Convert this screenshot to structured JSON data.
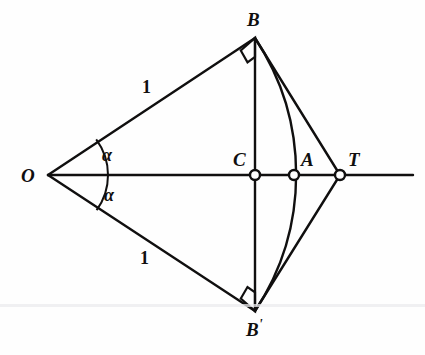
{
  "figure": {
    "background_color": "#fefefe",
    "stroke_color": "#100f0f",
    "canvas": {
      "width": 425,
      "height": 355
    }
  },
  "points": [
    {
      "id": "O",
      "label": "O",
      "x": 48,
      "y": 175,
      "marker": "vertex",
      "label_x": 21,
      "label_y": 166
    },
    {
      "id": "B",
      "label": "B",
      "x": 255,
      "y": 38,
      "marker": "vertex",
      "label_x": 247,
      "label_y": 10
    },
    {
      "id": "Bp",
      "label": "B",
      "label_suffix": "'",
      "x": 255,
      "y": 311,
      "marker": "vertex",
      "label_x": 246,
      "label_y": 318
    },
    {
      "id": "C",
      "label": "C",
      "x": 255,
      "y": 175,
      "marker": "open-circle",
      "label_x": 233,
      "label_y": 150
    },
    {
      "id": "A",
      "label": "A",
      "x": 294,
      "y": 175,
      "marker": "open-circle",
      "label_x": 301,
      "label_y": 150
    },
    {
      "id": "T",
      "label": "T",
      "x": 340,
      "y": 175,
      "marker": "open-circle",
      "label_x": 348,
      "label_y": 150
    }
  ],
  "segment_labels": [
    {
      "id": "len-ob",
      "text": "1",
      "x": 142,
      "y": 78
    },
    {
      "id": "len-obp",
      "text": "1",
      "x": 140,
      "y": 249
    }
  ],
  "angle_labels": [
    {
      "id": "angle-upper",
      "text": "α",
      "x": 102,
      "y": 146
    },
    {
      "id": "angle-lower",
      "text": "α",
      "x": 104,
      "y": 186
    }
  ],
  "geometry": {
    "axis_line": {
      "x1": 48,
      "y1": 175,
      "x2": 413,
      "y2": 175
    },
    "segment_O_B": {
      "x1": 48,
      "y1": 175,
      "x2": 255,
      "y2": 38
    },
    "segment_O_Bp": {
      "x1": 48,
      "y1": 175,
      "x2": 255,
      "y2": 311
    },
    "segment_B_T": {
      "x1": 255,
      "y1": 38,
      "x2": 340,
      "y2": 175
    },
    "segment_Bp_T": {
      "x1": 255,
      "y1": 311,
      "x2": 340,
      "y2": 175
    },
    "chord_B_Bp": {
      "x1": 255,
      "y1": 38,
      "x2": 255,
      "y2": 311
    },
    "arc_B_A_Bp": {
      "start_x": 255,
      "start_y": 38,
      "end_x": 255,
      "end_y": 311,
      "radius": 247,
      "sweep": 1,
      "through_x": 294,
      "through_y": 175
    },
    "right_angle_B": {
      "size": 19,
      "at_x": 255,
      "at_y": 38
    },
    "right_angle_Bp": {
      "size": 19,
      "at_x": 255,
      "at_y": 311
    },
    "angle_arc_upper": {
      "cx": 48,
      "cy": 175,
      "radius": 60
    },
    "angle_arc_lower": {
      "cx": 48,
      "cy": 175,
      "radius": 60
    }
  },
  "artifacts": [
    {
      "id": "scan-line",
      "y": 304
    }
  ]
}
